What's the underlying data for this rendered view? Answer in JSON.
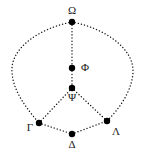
{
  "figure": {
    "type": "node-link-diagram",
    "background_color": "#ffffff",
    "stroke_color": "#1a1a1a",
    "node_color": "#000000",
    "line_style": "dotted",
    "node_radius": 3,
    "width": 147,
    "height": 159
  },
  "nodes": [
    {
      "id": "omega",
      "label": "Ω",
      "x": 72,
      "y": 22,
      "label_x": 72,
      "label_y": 10,
      "label_anchor": "above"
    },
    {
      "id": "phi",
      "label": "Φ",
      "x": 72,
      "y": 68,
      "label_x": 84,
      "label_y": 64,
      "label_anchor": "right"
    },
    {
      "id": "psi",
      "label": "Ψ",
      "x": 72,
      "y": 88,
      "label_x": 72,
      "label_y": 93,
      "label_anchor": "below"
    },
    {
      "id": "gamma",
      "label": "Γ",
      "x": 39,
      "y": 123,
      "label_x": 28,
      "label_y": 123,
      "label_anchor": "left"
    },
    {
      "id": "lambda",
      "label": "Λ",
      "x": 107,
      "y": 121,
      "label_x": 115,
      "label_y": 127,
      "label_anchor": "below-right"
    },
    {
      "id": "delta",
      "label": "Δ",
      "x": 72,
      "y": 134,
      "label_x": 72,
      "label_y": 141,
      "label_anchor": "below"
    }
  ],
  "edges": [
    {
      "id": "omega-phi",
      "from": "omega",
      "to": "phi",
      "shape": "straight",
      "style": "dotted"
    },
    {
      "id": "phi-psi",
      "from": "phi",
      "to": "psi",
      "shape": "straight",
      "style": "dotted"
    },
    {
      "id": "psi-gamma",
      "from": "psi",
      "to": "gamma",
      "shape": "straight",
      "style": "dotted"
    },
    {
      "id": "psi-lambda",
      "from": "psi",
      "to": "lambda",
      "shape": "straight",
      "style": "dotted"
    },
    {
      "id": "gamma-delta",
      "from": "gamma",
      "to": "delta",
      "shape": "straight",
      "style": "dotted"
    },
    {
      "id": "delta-lambda",
      "from": "delta",
      "to": "lambda",
      "shape": "straight",
      "style": "dotted"
    },
    {
      "id": "omega-gamma",
      "from": "omega",
      "to": "gamma",
      "shape": "curve-left",
      "style": "dotted"
    },
    {
      "id": "omega-lambda",
      "from": "omega",
      "to": "lambda",
      "shape": "curve-right",
      "style": "dotted"
    }
  ],
  "paths": {
    "omega_gamma": "M 72 22 C 40 28, 10 48, 12 72 C 13 92, 28 110, 39 123",
    "omega_lambda": "M 72 22 C 104 28, 134 48, 133 72 C 132 92, 118 110, 107 121"
  }
}
